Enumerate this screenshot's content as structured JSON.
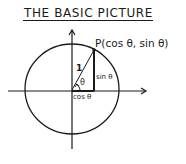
{
  "title": "The Basic Picture",
  "title_display": "THE BASIC PICTURE",
  "diagram": {
    "type": "unit-circle",
    "point_label": "P(cos θ, sin θ)",
    "radius_label": "1",
    "angle_label": "θ",
    "adjacent_label": "cos θ",
    "opposite_label": "sin θ"
  },
  "colors": {
    "ink": "#1a1a1a",
    "background": "#ffffff"
  }
}
